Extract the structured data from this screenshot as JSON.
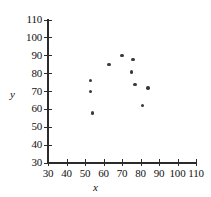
{
  "chart_data": {
    "type": "scatter",
    "title": "",
    "xlabel": "x",
    "ylabel": "y",
    "xlim": [
      30,
      110
    ],
    "ylim": [
      30,
      110
    ],
    "xticks": [
      30,
      40,
      50,
      60,
      70,
      80,
      90,
      100,
      110
    ],
    "yticks": [
      30,
      40,
      50,
      60,
      70,
      80,
      90,
      100,
      110
    ],
    "grid": false,
    "legend": null,
    "points": [
      {
        "x": 53,
        "y": 76
      },
      {
        "x": 53,
        "y": 70
      },
      {
        "x": 54,
        "y": 58
      },
      {
        "x": 63,
        "y": 85
      },
      {
        "x": 70,
        "y": 90
      },
      {
        "x": 76,
        "y": 88
      },
      {
        "x": 75,
        "y": 81
      },
      {
        "x": 77,
        "y": 74
      },
      {
        "x": 84,
        "y": 72
      },
      {
        "x": 81,
        "y": 62
      }
    ]
  }
}
